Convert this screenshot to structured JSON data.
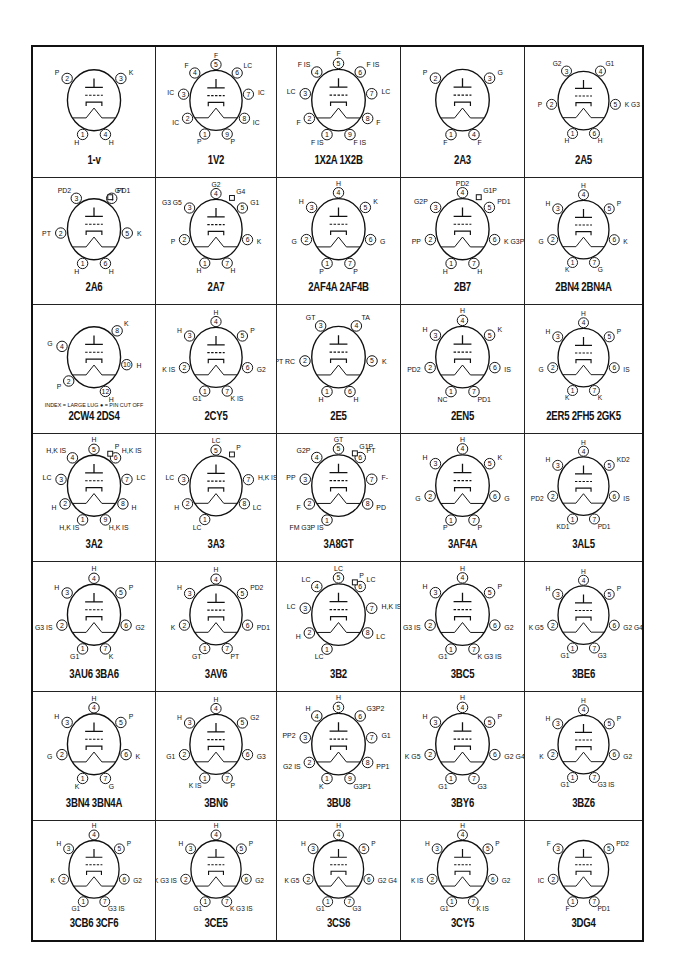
{
  "grid": {
    "rows": 7,
    "cols": 5
  },
  "tubes": [
    {
      "name": "1-v",
      "pins": [
        {
          "n": "1",
          "l": "H"
        },
        {
          "n": "2",
          "l": "P"
        },
        {
          "n": "3",
          "l": "K"
        },
        {
          "n": "4",
          "l": "H"
        }
      ]
    },
    {
      "name": "1V2",
      "pins": [
        {
          "n": "1",
          "l": "P"
        },
        {
          "n": "2",
          "l": "IC"
        },
        {
          "n": "3",
          "l": "IC"
        },
        {
          "n": "4",
          "l": "F"
        },
        {
          "n": "5",
          "l": "F"
        },
        {
          "n": "6",
          "l": "LC"
        },
        {
          "n": "7",
          "l": "IC"
        },
        {
          "n": "8",
          "l": "IC"
        },
        {
          "n": "9",
          "l": "P"
        }
      ]
    },
    {
      "name": "1X2A   1X2B",
      "pins": [
        {
          "n": "1",
          "l": "F IS"
        },
        {
          "n": "2",
          "l": "F"
        },
        {
          "n": "3",
          "l": "LC"
        },
        {
          "n": "4",
          "l": "F IS"
        },
        {
          "n": "5",
          "l": "F"
        },
        {
          "n": "6",
          "l": "F IS"
        },
        {
          "n": "7",
          "l": "LC"
        },
        {
          "n": "8",
          "l": "F"
        },
        {
          "n": "9",
          "l": "F IS"
        }
      ]
    },
    {
      "name": "2A3",
      "pins": [
        {
          "n": "1",
          "l": "F"
        },
        {
          "n": "2",
          "l": "P"
        },
        {
          "n": "3",
          "l": "G"
        },
        {
          "n": "4",
          "l": "F"
        }
      ]
    },
    {
      "name": "2A5",
      "pins": [
        {
          "n": "1",
          "l": "H"
        },
        {
          "n": "2",
          "l": "P"
        },
        {
          "n": "3",
          "l": "G2"
        },
        {
          "n": "4",
          "l": "G1"
        },
        {
          "n": "5",
          "l": "K G3"
        },
        {
          "n": "6",
          "l": "H"
        }
      ]
    },
    {
      "name": "2A6",
      "pins": [
        {
          "n": "1",
          "l": "H"
        },
        {
          "n": "2",
          "l": "PT"
        },
        {
          "n": "3",
          "l": "PD2"
        },
        {
          "n": "4",
          "l": "PD1"
        },
        {
          "n": "5",
          "l": "K"
        },
        {
          "n": "6",
          "l": "H"
        },
        {
          "n": "cap",
          "l": "GT"
        }
      ]
    },
    {
      "name": "2A7",
      "pins": [
        {
          "n": "1",
          "l": "H"
        },
        {
          "n": "2",
          "l": "P"
        },
        {
          "n": "3",
          "l": "G3 G5"
        },
        {
          "n": "4",
          "l": "G2"
        },
        {
          "n": "5",
          "l": "G1"
        },
        {
          "n": "6",
          "l": "K"
        },
        {
          "n": "7",
          "l": "H"
        },
        {
          "n": "cap",
          "l": "G4"
        }
      ]
    },
    {
      "name": "2AF4A   2AF4B",
      "pins": [
        {
          "n": "1",
          "l": "P"
        },
        {
          "n": "2",
          "l": "G"
        },
        {
          "n": "3",
          "l": "H"
        },
        {
          "n": "4",
          "l": "H"
        },
        {
          "n": "5",
          "l": "K"
        },
        {
          "n": "6",
          "l": "G"
        },
        {
          "n": "7",
          "l": "P"
        }
      ]
    },
    {
      "name": "2B7",
      "pins": [
        {
          "n": "1",
          "l": "H"
        },
        {
          "n": "2",
          "l": "PP"
        },
        {
          "n": "3",
          "l": "G2P"
        },
        {
          "n": "4",
          "l": "PD2"
        },
        {
          "n": "5",
          "l": "PD1"
        },
        {
          "n": "6",
          "l": "K G3P"
        },
        {
          "n": "7",
          "l": "H"
        },
        {
          "n": "cap",
          "l": "G1P"
        }
      ]
    },
    {
      "name": "2BN4   2BN4A",
      "pins": [
        {
          "n": "1",
          "l": "K"
        },
        {
          "n": "2",
          "l": "G"
        },
        {
          "n": "3",
          "l": "H"
        },
        {
          "n": "4",
          "l": "H"
        },
        {
          "n": "5",
          "l": "P"
        },
        {
          "n": "6",
          "l": "K"
        },
        {
          "n": "7",
          "l": "G"
        }
      ]
    },
    {
      "name": "2CW4   2DS4",
      "note": "INDEX = LARGE LUG  ● = PIN CUT OFF",
      "pins": [
        {
          "n": "2",
          "l": "P"
        },
        {
          "n": "4",
          "l": "G"
        },
        {
          "n": "8",
          "l": "K"
        },
        {
          "n": "10",
          "l": "H"
        },
        {
          "n": "12",
          "l": "H"
        }
      ]
    },
    {
      "name": "2CY5",
      "pins": [
        {
          "n": "1",
          "l": "G1"
        },
        {
          "n": "2",
          "l": "K IS"
        },
        {
          "n": "3",
          "l": "H"
        },
        {
          "n": "4",
          "l": "H"
        },
        {
          "n": "5",
          "l": "P"
        },
        {
          "n": "6",
          "l": "G2"
        },
        {
          "n": "7",
          "l": "K IS"
        }
      ]
    },
    {
      "name": "2E5",
      "pins": [
        {
          "n": "1",
          "l": "H"
        },
        {
          "n": "2",
          "l": "PT RC"
        },
        {
          "n": "3",
          "l": "GT"
        },
        {
          "n": "4",
          "l": "TA"
        },
        {
          "n": "5",
          "l": "K"
        },
        {
          "n": "6",
          "l": "H"
        }
      ]
    },
    {
      "name": "2EN5",
      "pins": [
        {
          "n": "1",
          "l": "NC"
        },
        {
          "n": "2",
          "l": "PD2"
        },
        {
          "n": "3",
          "l": "H"
        },
        {
          "n": "4",
          "l": "H"
        },
        {
          "n": "5",
          "l": "K"
        },
        {
          "n": "6",
          "l": "IS"
        },
        {
          "n": "7",
          "l": "PD1"
        }
      ]
    },
    {
      "name": "2ER5   2FH5   2GK5",
      "pins": [
        {
          "n": "1",
          "l": "K"
        },
        {
          "n": "2",
          "l": "G"
        },
        {
          "n": "3",
          "l": "H"
        },
        {
          "n": "4",
          "l": "H"
        },
        {
          "n": "5",
          "l": "P"
        },
        {
          "n": "6",
          "l": "IS"
        },
        {
          "n": "7",
          "l": "K"
        }
      ]
    },
    {
      "name": "3A2",
      "pins": [
        {
          "n": "1",
          "l": "H,K IS"
        },
        {
          "n": "2",
          "l": "H"
        },
        {
          "n": "3",
          "l": "LC"
        },
        {
          "n": "4",
          "l": "H,K IS"
        },
        {
          "n": "5",
          "l": "H"
        },
        {
          "n": "6",
          "l": "H,K IS"
        },
        {
          "n": "7",
          "l": "LC"
        },
        {
          "n": "8",
          "l": "H"
        },
        {
          "n": "9",
          "l": "H,K IS"
        },
        {
          "n": "cap",
          "l": "P"
        }
      ]
    },
    {
      "name": "3A3",
      "pins": [
        {
          "n": "1",
          "l": "LC"
        },
        {
          "n": "2",
          "l": "H"
        },
        {
          "n": "3",
          "l": "LC"
        },
        {
          "n": "5",
          "l": "LC"
        },
        {
          "n": "7",
          "l": "H,K IS"
        },
        {
          "n": "8",
          "l": "LC"
        },
        {
          "n": "cap",
          "l": "P"
        }
      ]
    },
    {
      "name": "3A8GT",
      "pins": [
        {
          "n": "1",
          "l": "FM G3P IS"
        },
        {
          "n": "2",
          "l": "F"
        },
        {
          "n": "3",
          "l": "PP"
        },
        {
          "n": "4",
          "l": "G2P"
        },
        {
          "n": "5",
          "l": "GT"
        },
        {
          "n": "6",
          "l": "PT"
        },
        {
          "n": "7",
          "l": "F-"
        },
        {
          "n": "8",
          "l": "PD"
        },
        {
          "n": "cap",
          "l": "G1P"
        }
      ]
    },
    {
      "name": "3AF4A",
      "pins": [
        {
          "n": "1",
          "l": "P"
        },
        {
          "n": "2",
          "l": "G"
        },
        {
          "n": "3",
          "l": "H"
        },
        {
          "n": "4",
          "l": "H"
        },
        {
          "n": "5",
          "l": "K"
        },
        {
          "n": "6",
          "l": "G"
        },
        {
          "n": "7",
          "l": "P"
        }
      ]
    },
    {
      "name": "3AL5",
      "pins": [
        {
          "n": "1",
          "l": "KD1"
        },
        {
          "n": "2",
          "l": "PD2"
        },
        {
          "n": "3",
          "l": "H"
        },
        {
          "n": "4",
          "l": "H"
        },
        {
          "n": "5",
          "l": "KD2"
        },
        {
          "n": "6",
          "l": "IS"
        },
        {
          "n": "7",
          "l": "PD1"
        }
      ]
    },
    {
      "name": "3AU6   3BA6",
      "pins": [
        {
          "n": "1",
          "l": "G1"
        },
        {
          "n": "2",
          "l": "G3 IS"
        },
        {
          "n": "3",
          "l": "H"
        },
        {
          "n": "4",
          "l": "H"
        },
        {
          "n": "5",
          "l": "P"
        },
        {
          "n": "6",
          "l": "G2"
        },
        {
          "n": "7",
          "l": "K"
        }
      ]
    },
    {
      "name": "3AV6",
      "pins": [
        {
          "n": "1",
          "l": "GT"
        },
        {
          "n": "2",
          "l": "K"
        },
        {
          "n": "3",
          "l": "H"
        },
        {
          "n": "4",
          "l": "H"
        },
        {
          "n": "5",
          "l": "PD2"
        },
        {
          "n": "6",
          "l": "PD1"
        },
        {
          "n": "7",
          "l": "PT"
        }
      ]
    },
    {
      "name": "3B2",
      "pins": [
        {
          "n": "1",
          "l": "LC"
        },
        {
          "n": "2",
          "l": "H"
        },
        {
          "n": "3",
          "l": "LC"
        },
        {
          "n": "4",
          "l": "LC"
        },
        {
          "n": "5",
          "l": "LC"
        },
        {
          "n": "6",
          "l": "LC"
        },
        {
          "n": "7",
          "l": "H,K IS"
        },
        {
          "n": "8",
          "l": "LC"
        },
        {
          "n": "cap",
          "l": "P"
        }
      ]
    },
    {
      "name": "3BC5",
      "pins": [
        {
          "n": "1",
          "l": "G1"
        },
        {
          "n": "2",
          "l": "K G3 IS"
        },
        {
          "n": "3",
          "l": "H"
        },
        {
          "n": "4",
          "l": "H"
        },
        {
          "n": "5",
          "l": "P"
        },
        {
          "n": "6",
          "l": "G2"
        },
        {
          "n": "7",
          "l": "K G3 IS"
        }
      ]
    },
    {
      "name": "3BE6",
      "pins": [
        {
          "n": "1",
          "l": "G1"
        },
        {
          "n": "2",
          "l": "K G5"
        },
        {
          "n": "3",
          "l": "H"
        },
        {
          "n": "4",
          "l": "H"
        },
        {
          "n": "5",
          "l": "P"
        },
        {
          "n": "6",
          "l": "G2 G4"
        },
        {
          "n": "7",
          "l": "G3"
        }
      ]
    },
    {
      "name": "3BN4   3BN4A",
      "pins": [
        {
          "n": "1",
          "l": "K"
        },
        {
          "n": "2",
          "l": "G"
        },
        {
          "n": "3",
          "l": "H"
        },
        {
          "n": "4",
          "l": "H"
        },
        {
          "n": "5",
          "l": "P"
        },
        {
          "n": "6",
          "l": "K"
        },
        {
          "n": "7",
          "l": "G"
        }
      ]
    },
    {
      "name": "3BN6",
      "pins": [
        {
          "n": "1",
          "l": "K IS"
        },
        {
          "n": "2",
          "l": "G1"
        },
        {
          "n": "3",
          "l": "H"
        },
        {
          "n": "4",
          "l": "H"
        },
        {
          "n": "5",
          "l": "G2"
        },
        {
          "n": "6",
          "l": "G3"
        },
        {
          "n": "7",
          "l": "P"
        }
      ]
    },
    {
      "name": "3BU8",
      "pins": [
        {
          "n": "1",
          "l": "K"
        },
        {
          "n": "2",
          "l": "G2 IS"
        },
        {
          "n": "3",
          "l": "PP2"
        },
        {
          "n": "4",
          "l": "H"
        },
        {
          "n": "5",
          "l": "H"
        },
        {
          "n": "6",
          "l": "G3P2"
        },
        {
          "n": "7",
          "l": "G1"
        },
        {
          "n": "8",
          "l": "PP1"
        },
        {
          "n": "9",
          "l": "G3P1"
        }
      ]
    },
    {
      "name": "3BY6",
      "pins": [
        {
          "n": "1",
          "l": "G1"
        },
        {
          "n": "2",
          "l": "K G5"
        },
        {
          "n": "3",
          "l": "H"
        },
        {
          "n": "4",
          "l": "H"
        },
        {
          "n": "5",
          "l": "P"
        },
        {
          "n": "6",
          "l": "G2 G4"
        },
        {
          "n": "7",
          "l": "G3"
        }
      ]
    },
    {
      "name": "3BZ6",
      "pins": [
        {
          "n": "1",
          "l": "G1"
        },
        {
          "n": "2",
          "l": "K"
        },
        {
          "n": "3",
          "l": "H"
        },
        {
          "n": "4",
          "l": "H"
        },
        {
          "n": "5",
          "l": "P"
        },
        {
          "n": "6",
          "l": "G2"
        },
        {
          "n": "7",
          "l": "G3 IS"
        }
      ]
    },
    {
      "name": "3CB6   3CF6",
      "pins": [
        {
          "n": "1",
          "l": "G1"
        },
        {
          "n": "2",
          "l": "K"
        },
        {
          "n": "3",
          "l": "H"
        },
        {
          "n": "4",
          "l": "H"
        },
        {
          "n": "5",
          "l": "P"
        },
        {
          "n": "6",
          "l": "G2"
        },
        {
          "n": "7",
          "l": "G3 IS"
        }
      ]
    },
    {
      "name": "3CE5",
      "pins": [
        {
          "n": "1",
          "l": "G1"
        },
        {
          "n": "2",
          "l": "K G3 IS"
        },
        {
          "n": "3",
          "l": "H"
        },
        {
          "n": "4",
          "l": "H"
        },
        {
          "n": "5",
          "l": "P"
        },
        {
          "n": "6",
          "l": "G2"
        },
        {
          "n": "7",
          "l": "K G3 IS"
        }
      ]
    },
    {
      "name": "3CS6",
      "pins": [
        {
          "n": "1",
          "l": "G1"
        },
        {
          "n": "2",
          "l": "K G5"
        },
        {
          "n": "3",
          "l": "H"
        },
        {
          "n": "4",
          "l": "H"
        },
        {
          "n": "5",
          "l": "P"
        },
        {
          "n": "6",
          "l": "G2 G4"
        },
        {
          "n": "7",
          "l": "G3"
        }
      ]
    },
    {
      "name": "3CY5",
      "pins": [
        {
          "n": "1",
          "l": "G1"
        },
        {
          "n": "2",
          "l": "K IS"
        },
        {
          "n": "3",
          "l": "H"
        },
        {
          "n": "4",
          "l": "H"
        },
        {
          "n": "5",
          "l": "P"
        },
        {
          "n": "6",
          "l": "G2"
        },
        {
          "n": "7",
          "l": "K IS"
        }
      ]
    },
    {
      "name": "3DG4",
      "pins": [
        {
          "n": "1",
          "l": "F"
        },
        {
          "n": "2",
          "l": "IC"
        },
        {
          "n": "3",
          "l": "F"
        },
        {
          "n": "5",
          "l": "PD2"
        },
        {
          "n": "7",
          "l": "PD1"
        }
      ]
    }
  ]
}
